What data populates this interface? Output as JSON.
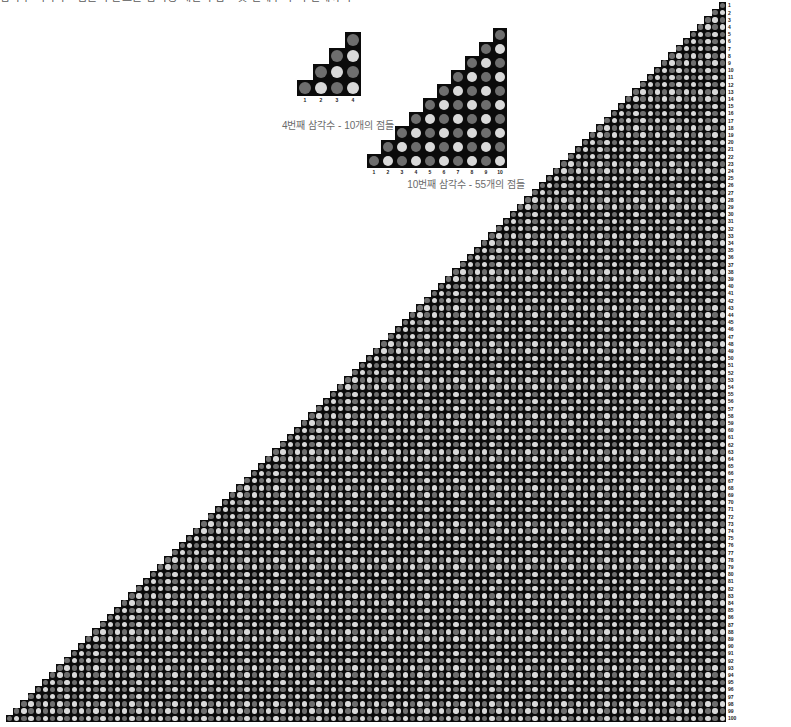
{
  "page": {
    "title": "삼각수 시각화 - 점들이 만드는 삼각형 패턴과 합 - 첫 번째부터 백 번째까지",
    "background_color": "#ffffff"
  },
  "palette": {
    "cell_background": "#0b0b0b",
    "dot_light": "#d9d9d9",
    "dot_dark": "#6e6e6e",
    "label_color": "#1b1b1b",
    "caption_color": "#6b6b6b"
  },
  "figures": {
    "small": {
      "name": "4th-triangular-number",
      "caption": "4번째 삼각수 - 10개의 점들",
      "n": 4,
      "total_dots": 10,
      "cell_size": 16,
      "dot_size": 12,
      "column_labels": [
        "1",
        "2",
        "3",
        "4"
      ],
      "column_heights": [
        1,
        2,
        3,
        4
      ]
    },
    "medium": {
      "name": "10th-triangular-number",
      "caption": "10번째 삼각수 - 55개의 점들",
      "n": 10,
      "total_dots": 55,
      "cell_size": 14,
      "dot_size": 10,
      "column_labels": [
        "1",
        "2",
        "3",
        "4",
        "5",
        "6",
        "7",
        "8",
        "9",
        "10"
      ],
      "column_heights": [
        1,
        2,
        3,
        4,
        5,
        6,
        7,
        8,
        9,
        10
      ]
    },
    "big": {
      "name": "100th-triangular-number",
      "caption": "",
      "n": 100,
      "total_dots": 5050,
      "cell_size": 7.2,
      "dot_size": 5.4,
      "row_label_first": 1,
      "row_label_last": 100
    }
  },
  "chart_data": {
    "type": "bar",
    "title": "삼각수 시각화 - 점들이 만드는 삼각형 패턴과 합 - 첫 번째부터 백 번째까지",
    "xlabel": "",
    "ylabel": "",
    "series": [
      {
        "name": "4번째 삼각수 - 10개의 점들",
        "categories": [
          "1",
          "2",
          "3",
          "4"
        ],
        "values": [
          1,
          2,
          3,
          4
        ],
        "sum": 10
      },
      {
        "name": "10번째 삼각수 - 55개의 점들",
        "categories": [
          "1",
          "2",
          "3",
          "4",
          "5",
          "6",
          "7",
          "8",
          "9",
          "10"
        ],
        "values": [
          1,
          2,
          3,
          4,
          5,
          6,
          7,
          8,
          9,
          10
        ],
        "sum": 55
      },
      {
        "name": "100번째 삼각수 - 5050개의 점들",
        "categories": [
          "1",
          "100"
        ],
        "values": [
          1,
          100
        ],
        "sum": 5050
      }
    ],
    "grid": false,
    "legend": "none"
  }
}
